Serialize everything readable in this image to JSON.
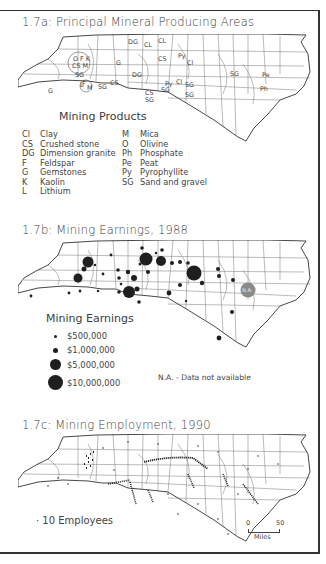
{
  "figure": {
    "panel_a": {
      "title": "1.7a: Principal Mineral Producing Areas",
      "legend_title": "Mining Products",
      "products_left": [
        {
          "code": "Cl",
          "name": "Clay"
        },
        {
          "code": "CS",
          "name": "Crushed stone"
        },
        {
          "code": "DG",
          "name": "Dimension granite"
        },
        {
          "code": "F",
          "name": "Feldspar"
        },
        {
          "code": "G",
          "name": "Gemstones"
        },
        {
          "code": "K",
          "name": "Kaolin"
        },
        {
          "code": "L",
          "name": "Lithium"
        }
      ],
      "products_right": [
        {
          "code": "M",
          "name": "Mica"
        },
        {
          "code": "O",
          "name": "Olivine"
        },
        {
          "code": "Ph",
          "name": "Phosphate"
        },
        {
          "code": "Pe",
          "name": "Peat"
        },
        {
          "code": "Py",
          "name": "Pyrophyllite"
        },
        {
          "code": "SG",
          "name": "Sand and gravel"
        }
      ],
      "map_labels": [
        "DG",
        "CL",
        "CL",
        "CS",
        "Py",
        "Cl",
        "O",
        "F",
        "K",
        "CS",
        "M",
        "G",
        "SG",
        "L",
        "DG",
        "G",
        "F",
        "M",
        "SG",
        "CS",
        "Py",
        "Cl",
        "SG",
        "CS",
        "SG",
        "SG",
        "SG",
        "SG",
        "Pe",
        "Ph"
      ]
    },
    "panel_b": {
      "title": "1.7b: Mining Earnings, 1988",
      "legend_title": "Mining Earnings",
      "legend": [
        {
          "label": "$500,000",
          "size": 3
        },
        {
          "label": "$1,000,000",
          "size": 5
        },
        {
          "label": "$5,000,000",
          "size": 11
        },
        {
          "label": "$10,000,000",
          "size": 16
        }
      ],
      "na_label": "N.A.",
      "na_note": "N.A. - Data not available"
    },
    "panel_c": {
      "title": "1.7c: Mining Employment, 1990",
      "legend": "· 10 Employees",
      "scale": {
        "start": "0",
        "end": "50",
        "unit": "Miles"
      }
    }
  },
  "colors": {
    "ink": "#2a2a2a",
    "text": "#444444",
    "na_fill": "#8a8a8a",
    "border": "#333333"
  }
}
